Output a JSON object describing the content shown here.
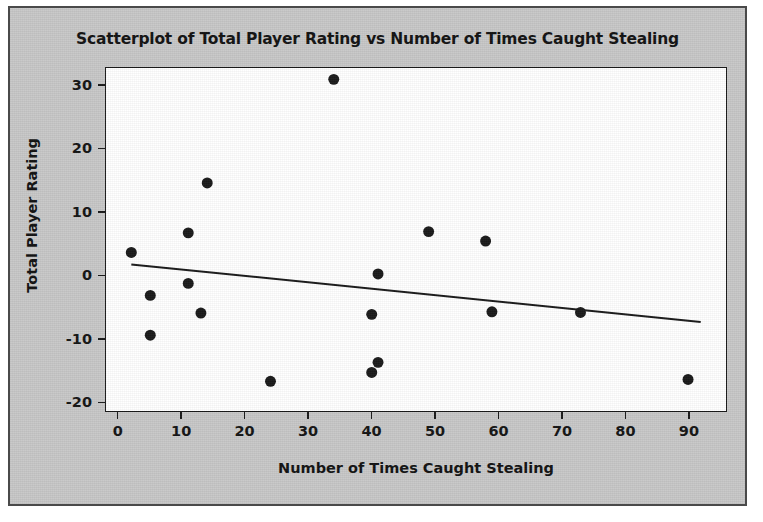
{
  "figure": {
    "background_color": "#c8c8c8",
    "plot_background_color": "#ffffff",
    "border_color": "#4a4a4a",
    "marker_color": "#1a1a1a",
    "line_color": "#1a1a1a"
  },
  "chart_data": {
    "type": "scatter",
    "title": "Scatterplot of Total Player Rating vs Number of Times Caught Stealing",
    "xlabel": "Number of Times Caught Stealing",
    "ylabel": "Total Player Rating",
    "xlim": [
      -2,
      96
    ],
    "ylim": [
      -21.5,
      32.8
    ],
    "xticks": [
      0,
      10,
      20,
      30,
      40,
      50,
      60,
      70,
      80,
      90
    ],
    "xtick_labels": [
      "0",
      "10",
      "20",
      "30",
      "40",
      "50",
      "60",
      "70",
      "80",
      "90"
    ],
    "yticks": [
      -20,
      -10,
      0,
      10,
      20,
      30
    ],
    "ytick_labels": [
      "-20",
      "-10",
      "0",
      "10",
      "20",
      "30"
    ],
    "grid": false,
    "legend": false,
    "points": [
      {
        "x": 2,
        "y": 3.6
      },
      {
        "x": 5,
        "y": -3.2
      },
      {
        "x": 5,
        "y": -9.5
      },
      {
        "x": 11,
        "y": 6.7
      },
      {
        "x": 11,
        "y": -1.3
      },
      {
        "x": 13,
        "y": -6.0
      },
      {
        "x": 14,
        "y": 14.6
      },
      {
        "x": 24,
        "y": -16.8
      },
      {
        "x": 34,
        "y": 31.0
      },
      {
        "x": 40,
        "y": -6.2
      },
      {
        "x": 41,
        "y": 0.2
      },
      {
        "x": 41,
        "y": -13.8
      },
      {
        "x": 40,
        "y": -15.4
      },
      {
        "x": 49,
        "y": 6.9
      },
      {
        "x": 58,
        "y": 5.4
      },
      {
        "x": 59,
        "y": -5.8
      },
      {
        "x": 73,
        "y": -5.9
      },
      {
        "x": 90,
        "y": -16.5
      }
    ],
    "fit_line": {
      "name": "regression-line",
      "x_start": 2,
      "y_start": 1.7,
      "x_end": 92,
      "y_end": -7.4
    },
    "marker_style": "filled-circle",
    "marker_size_px": 11
  }
}
